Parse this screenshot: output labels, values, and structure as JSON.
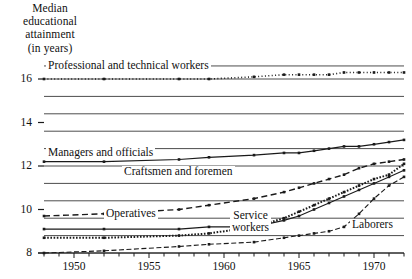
{
  "axis_title": {
    "lines": [
      "Median",
      "educational",
      "attainment",
      "(in years)"
    ]
  },
  "chart_data": {
    "type": "line",
    "title": "Median educational attainment (in years)",
    "xlabel": "",
    "ylabel": "Median educational attainment (in years)",
    "xlim": [
      1948,
      1972
    ],
    "ylim": [
      8,
      17
    ],
    "grid": true,
    "legend": "inline-labels",
    "yticks": [
      8,
      10,
      12,
      14,
      16
    ],
    "ytick_labels": [
      "8",
      "10",
      "12",
      "14",
      "16"
    ],
    "xticks": [
      1950,
      1955,
      1960,
      1965,
      1970
    ],
    "xtick_labels": [
      "1950",
      "1955",
      "1960",
      "1965",
      "1970"
    ],
    "xticks_minor": [
      1948,
      1949,
      1950,
      1951,
      1952,
      1953,
      1954,
      1955,
      1956,
      1957,
      1958,
      1959,
      1960,
      1961,
      1962,
      1963,
      1964,
      1965,
      1966,
      1967,
      1968,
      1969,
      1970,
      1971,
      1972
    ],
    "x": [
      1948,
      1952,
      1957,
      1959,
      1962,
      1964,
      1965,
      1966,
      1967,
      1968,
      1969,
      1970,
      1971,
      1972
    ],
    "series": [
      {
        "name": "Professional and technical workers",
        "label": "Professional and technical workers",
        "style": "dotted",
        "values": [
          16.0,
          16.0,
          16.0,
          16.0,
          16.1,
          16.2,
          16.2,
          16.2,
          16.2,
          16.3,
          16.3,
          16.3,
          16.3,
          16.3
        ]
      },
      {
        "name": "Managers and officials",
        "label": "Managers and officials",
        "style": "solid",
        "values": [
          12.2,
          12.2,
          12.3,
          12.4,
          12.5,
          12.6,
          12.6,
          12.7,
          12.8,
          12.9,
          12.9,
          13.0,
          13.1,
          13.2
        ]
      },
      {
        "name": "Craftsmen and foremen",
        "label": "Craftsmen and foremen",
        "style": "dashed",
        "values": [
          9.7,
          9.8,
          10.0,
          10.2,
          10.5,
          10.8,
          11.0,
          11.2,
          11.4,
          11.6,
          11.9,
          12.1,
          12.2,
          12.3
        ]
      },
      {
        "name": "Operatives",
        "label": "Operatives",
        "style": "solid-thin",
        "values": [
          9.1,
          9.1,
          9.1,
          9.2,
          9.2,
          9.5,
          9.7,
          10.0,
          10.3,
          10.6,
          10.9,
          11.2,
          11.5,
          11.8
        ]
      },
      {
        "name": "Service workers",
        "label": "Service\nworkers",
        "label_line1": "Service",
        "label_line2": "workers",
        "style": "thick-dotted",
        "values": [
          8.7,
          8.7,
          8.8,
          8.9,
          9.2,
          9.6,
          9.9,
          10.2,
          10.5,
          10.8,
          11.1,
          11.4,
          11.6,
          12.1
        ]
      },
      {
        "name": "Laborers",
        "label": "Laborers",
        "style": "dash-dot",
        "values": [
          8.0,
          8.1,
          8.3,
          8.4,
          8.5,
          8.7,
          8.8,
          8.9,
          9.0,
          9.2,
          9.8,
          10.5,
          11.1,
          11.5
        ]
      }
    ]
  },
  "colors": {
    "ink": "#1a1a1a",
    "grid": "#4d4d4d",
    "background": "#ffffff"
  }
}
